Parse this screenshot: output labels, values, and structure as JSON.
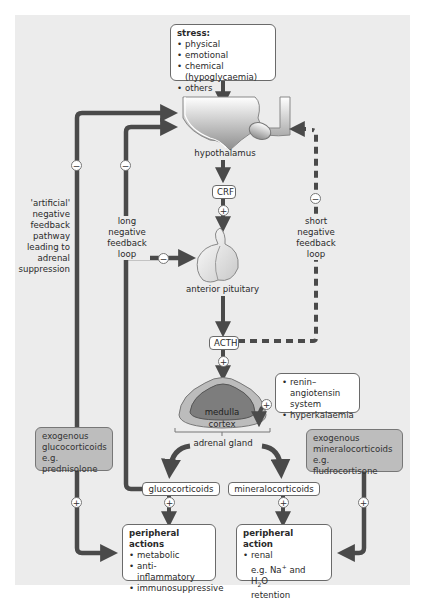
{
  "diagram": {
    "stress_box": {
      "title": "stress:",
      "items": [
        "physical",
        "emotional",
        "chemical (hypoglycaemia)",
        "others"
      ]
    },
    "organs": {
      "hypothalamus": "hypothalamus",
      "anterior_pituitary": "anterior pituitary",
      "adrenal_gland": "adrenal gland",
      "medulla": "medulla",
      "cortex": "cortex"
    },
    "hormones": {
      "crf": "CRF",
      "acth": "ACTH",
      "glucocorticoids": "glucocorticoids",
      "mineralocorticoids": "mineralocorticoids"
    },
    "feedback_labels": {
      "artificial": "'artificial' negative feedback pathway leading to adrenal suppression",
      "artificial_lines": [
        "'artificial'",
        "negative",
        "feedback",
        "pathway",
        "leading to",
        "adrenal",
        "suppression"
      ],
      "long_lines": [
        "long",
        "negative",
        "feedback",
        "loop"
      ],
      "short_lines": [
        "short",
        "negative",
        "feedback",
        "loop"
      ]
    },
    "renin_box": {
      "items": [
        "renin–angiotensin system",
        "hyperkalaemia"
      ]
    },
    "exogenous_gluco": {
      "lines": [
        "exogenous",
        "glucocorticoids",
        "e.g. prednisolone"
      ]
    },
    "exogenous_mineralo": {
      "lines": [
        "exogenous",
        "mineralocorticoids",
        "e.g. fludrocortisone"
      ]
    },
    "peripheral_actions": {
      "title": "peripheral actions",
      "items": [
        "metabolic",
        "anti-inflammatory",
        "immunosuppressive"
      ]
    },
    "peripheral_action": {
      "title": "peripheral action",
      "items": [
        "renal"
      ],
      "example_prefix": "e.g. Na",
      "example_sup": "+",
      "example_mid": " and H",
      "example_sub": "2",
      "example_suffix": "O",
      "example_line2": "retention"
    },
    "signs": {
      "plus": "+",
      "minus": "−"
    },
    "colors": {
      "panel_bg": "#ececec",
      "arrow": "#4a4a4a",
      "gray_box": "#bdbdbd",
      "medulla": "#7d7d7d",
      "cortex": "#bcbcbc"
    }
  }
}
